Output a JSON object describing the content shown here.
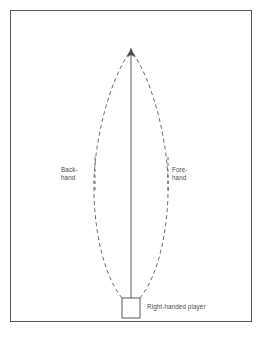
{
  "diagram": {
    "type": "tennis-stroke-coverage-diagram",
    "frame": {
      "border_color": "#565656",
      "background_color": "#ffffff"
    },
    "labels": {
      "backhand": "Back-\nhand",
      "forehand": "Fore-\nhand",
      "player": "Right-handed player"
    },
    "elements": {
      "player_box_name": "player-position-box",
      "center_line_name": "center-axis-arrow",
      "left_curve_name": "backhand-coverage-arc",
      "right_curve_name": "forehand-coverage-arc",
      "left_leader_name": "backhand-leader-line",
      "right_leader_name": "forehand-leader-line"
    },
    "colors": {
      "stroke": "#4a4a4a",
      "dash_stroke": "#5a5a5a",
      "text": "#4a4a4a"
    },
    "geometry": {
      "apex_x": 131,
      "apex_y": 49,
      "box_left": 122,
      "box_top": 298,
      "box_width": 18,
      "box_height": 20,
      "arc_max_left_x": 94,
      "arc_max_right_x": 169,
      "leader_left_x": 95,
      "leader_right_x": 168
    }
  }
}
